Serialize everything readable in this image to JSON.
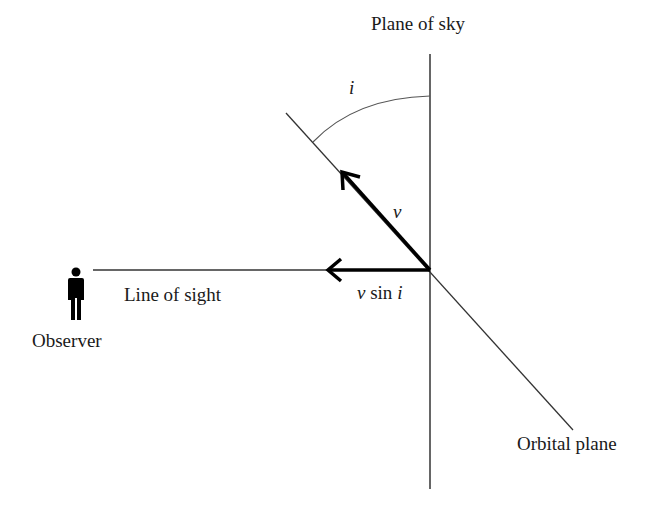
{
  "diagram": {
    "labels": {
      "plane_of_sky": "Plane of sky",
      "inclination": "i",
      "velocity": "v",
      "v_sin_i_v": "v",
      "v_sin_i_sin": " sin ",
      "v_sin_i_i": "i",
      "line_of_sight": "Line of sight",
      "observer": "Observer",
      "orbital_plane": "Orbital plane"
    },
    "icons": {
      "observer": "person-icon"
    },
    "colors": {
      "line": "#333333",
      "arrow": "#000000",
      "background": "#ffffff"
    }
  }
}
